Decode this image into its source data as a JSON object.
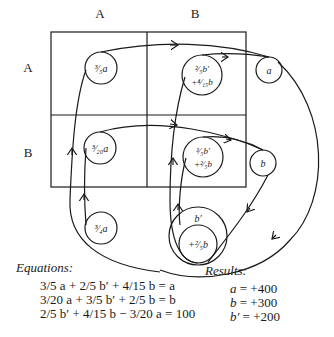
{
  "column_headers": [
    "A",
    "B"
  ],
  "row_headers": [
    "A",
    "B"
  ],
  "nodes": {
    "aa": {
      "coef": "3/5",
      "var": "a"
    },
    "ab": {
      "line1": "2/5 b′",
      "line2": "+ 4/15 b"
    },
    "ba": {
      "coef": "3/20",
      "var": "a"
    },
    "bb": {
      "line1": "3/5 b′",
      "line2": "+ 2/5 b"
    },
    "a_out": {
      "var": "a"
    },
    "b_out": {
      "var": "b"
    },
    "b_prime": {
      "var": "b′"
    },
    "b_prime_inner": {
      "text": "+ 2/5 b"
    },
    "quarter_a": {
      "coef": "3/4",
      "var": "a"
    }
  },
  "equations": {
    "title": "Equations:",
    "lines": [
      "3/5 a + 2/5 b′ + 4/15 b = a",
      "3/20 a + 3/5 b′ + 2/5 b = b",
      "2/5 b′ + 4/15 b − 3/20 a = 100"
    ]
  },
  "results": {
    "title": "Results:",
    "lines": [
      {
        "var": "a",
        "value": "+400"
      },
      {
        "var": "b",
        "value": "+300"
      },
      {
        "var": "b′",
        "value": "+200"
      }
    ]
  }
}
